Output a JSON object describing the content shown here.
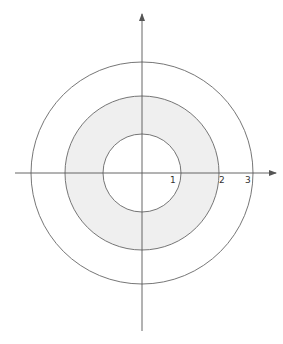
{
  "diagram": {
    "type": "annulus-on-axes",
    "center": {
      "x": 142,
      "y": 173
    },
    "unit_px": 38.5,
    "axes": {
      "x_axis": {
        "from": 15,
        "to": 276,
        "y": 173,
        "arrow": "right"
      },
      "y_axis": {
        "from": 331,
        "to": 14,
        "x": 142,
        "arrow": "up"
      },
      "color": "#555555"
    },
    "circles": [
      {
        "name": "inner",
        "radius_units": 1,
        "radius_px": 39
      },
      {
        "name": "middle",
        "radius_units": 2,
        "radius_px": 77
      },
      {
        "name": "outer",
        "radius_units": 3,
        "radius_px": 111
      }
    ],
    "shaded_region": {
      "inner_radius_units": 1,
      "outer_radius_units": 2,
      "fill": "#efefef"
    },
    "circle_stroke": "#666666",
    "tick_labels": [
      {
        "text": "1",
        "x": 170,
        "y": 183
      },
      {
        "text": "2",
        "x": 219,
        "y": 183
      },
      {
        "text": "3",
        "x": 245,
        "y": 183
      }
    ]
  }
}
